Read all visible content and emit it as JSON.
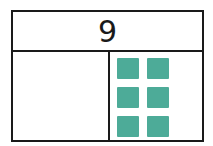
{
  "diagram": {
    "type": "part-whole bar model",
    "whole": {
      "value": "9"
    },
    "parts": [
      {
        "position": "left",
        "value": "",
        "squares": 0
      },
      {
        "position": "right",
        "value": "",
        "squares": 6
      }
    ],
    "colors": {
      "square": "#4dab98",
      "line": "#1a1a1a"
    }
  }
}
